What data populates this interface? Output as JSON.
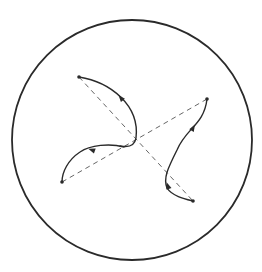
{
  "diagram": {
    "type": "geometric-curves-in-circle",
    "colors": {
      "background": "#ffffff",
      "stroke": "#2a2a2a",
      "dashed": "#555555"
    },
    "circle": {
      "cx": 132,
      "cy": 140,
      "r": 120
    },
    "endpoints": [
      {
        "name": "top-left",
        "x": 79,
        "y": 77
      },
      {
        "name": "right",
        "x": 207,
        "y": 99
      },
      {
        "name": "bottom-left",
        "x": 62,
        "y": 182
      },
      {
        "name": "bottom-right",
        "x": 193,
        "y": 201
      }
    ],
    "dashed_lines": [
      {
        "from": "top-left",
        "to": "bottom-right"
      },
      {
        "from": "bottom-left",
        "to": "right"
      }
    ],
    "curves": [
      {
        "name": "curve-top-left-to-center",
        "d": "M79,77 C110,82 140,105 136,138 C134,150 122,146 120,146"
      },
      {
        "name": "curve-center-to-bottom-left",
        "d": "M124,147 C110,143 90,145 80,152 C68,160 62,172 62,182"
      },
      {
        "name": "curve-right-to-bottom",
        "d": "M207,99 C204,125 186,128 177,150 C168,168 163,178 167,188"
      },
      {
        "name": "curve-bottom-to-bottom-right",
        "d": "M167,188 C172,196 185,199 193,201"
      }
    ],
    "arrows": [
      {
        "name": "arrow-top-left-curve",
        "x": 121,
        "y": 98,
        "angle": -130
      },
      {
        "name": "arrow-bottom-left-curve",
        "x": 92,
        "y": 150,
        "angle": 200
      },
      {
        "name": "arrow-right-curve",
        "x": 193,
        "y": 128,
        "angle": -60
      },
      {
        "name": "arrow-bottom-right-curve",
        "x": 168,
        "y": 186,
        "angle": -110
      }
    ]
  }
}
